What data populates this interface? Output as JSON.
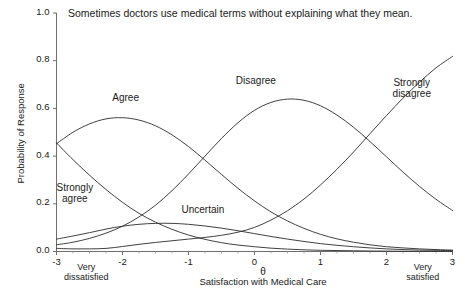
{
  "chart_data": {
    "type": "line",
    "title": "Sometimes doctors use medical terms without explaining what they mean.",
    "xlabel": "Satisfaction with Medical Care",
    "xlabel_symbol": "θ",
    "ylabel": "Probability of Response",
    "xlim": [
      -3,
      3
    ],
    "ylim": [
      0.0,
      1.0
    ],
    "grid": false,
    "legend_position": "inline-annotations",
    "xticks": [
      -3,
      -2,
      -1,
      0,
      1,
      2,
      3
    ],
    "xtick_labels": [
      "-3",
      "-2",
      "-1",
      "0",
      "1",
      "2",
      "3"
    ],
    "yticks": [
      0.0,
      0.2,
      0.4,
      0.6,
      0.8,
      1.0
    ],
    "ytick_labels": [
      "0.0",
      "0.2",
      "0.4",
      "0.6",
      "0.8",
      "1.0"
    ],
    "x_anchor_low": "Very\ndissatisfied",
    "x_anchor_high": "Very\nsatisfied",
    "x": [
      -3.0,
      -2.75,
      -2.5,
      -2.25,
      -2.0,
      -1.75,
      -1.5,
      -1.25,
      -1.0,
      -0.75,
      -0.5,
      -0.25,
      0.0,
      0.25,
      0.5,
      0.75,
      1.0,
      1.25,
      1.5,
      1.75,
      2.0,
      2.25,
      2.5,
      2.75,
      3.0
    ],
    "series": [
      {
        "name": "Strongly agree",
        "label": "Strongly\nagree",
        "label_x": -2.72,
        "label_y": 0.245,
        "values": [
          0.455,
          0.385,
          0.32,
          0.26,
          0.206,
          0.16,
          0.123,
          0.093,
          0.069,
          0.051,
          0.037,
          0.027,
          0.02,
          0.014,
          0.01,
          0.007,
          0.005,
          0.004,
          0.003,
          0.002,
          0.0015,
          0.001,
          0.0008,
          0.0006,
          0.0004
        ]
      },
      {
        "name": "Agree",
        "label": "Agree",
        "label_x": -1.95,
        "label_y": 0.645,
        "values": [
          0.452,
          0.5,
          0.535,
          0.556,
          0.561,
          0.551,
          0.527,
          0.489,
          0.44,
          0.383,
          0.323,
          0.265,
          0.212,
          0.166,
          0.128,
          0.097,
          0.072,
          0.053,
          0.039,
          0.028,
          0.02,
          0.015,
          0.011,
          0.008,
          0.006
        ]
      },
      {
        "name": "Uncertain",
        "label": "Uncertain",
        "label_x": -0.78,
        "label_y": 0.175,
        "values": [
          0.052,
          0.065,
          0.079,
          0.094,
          0.106,
          0.114,
          0.118,
          0.118,
          0.114,
          0.107,
          0.098,
          0.087,
          0.075,
          0.063,
          0.052,
          0.042,
          0.033,
          0.026,
          0.02,
          0.015,
          0.011,
          0.008,
          0.006,
          0.005,
          0.004
        ]
      },
      {
        "name": "Disagree",
        "label": "Disagree",
        "label_x": 0.02,
        "label_y": 0.715,
        "values": [
          0.028,
          0.039,
          0.055,
          0.077,
          0.106,
          0.145,
          0.194,
          0.255,
          0.325,
          0.4,
          0.474,
          0.54,
          0.592,
          0.625,
          0.639,
          0.634,
          0.611,
          0.572,
          0.521,
          0.461,
          0.397,
          0.333,
          0.273,
          0.219,
          0.172
        ]
      },
      {
        "name": "Strongly disagree",
        "label": "Strongly\ndisagree",
        "label_x": 2.38,
        "label_y": 0.685,
        "values": [
          0.013,
          0.011,
          0.011,
          0.013,
          0.021,
          0.03,
          0.038,
          0.045,
          0.052,
          0.059,
          0.068,
          0.081,
          0.101,
          0.132,
          0.171,
          0.22,
          0.279,
          0.345,
          0.417,
          0.494,
          0.57,
          0.643,
          0.71,
          0.77,
          0.818
        ]
      }
    ]
  },
  "style": {
    "line_color": "#2b2b2b",
    "axis_color": "#6e6e6e",
    "text_color": "#1a1a1a",
    "background": "#ffffff"
  }
}
